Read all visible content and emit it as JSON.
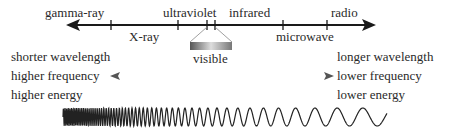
{
  "spectrum": {
    "top_labels": [
      "gamma-ray",
      "ultraviolet",
      "infrared",
      "radio"
    ],
    "bottom_labels": [
      "X-ray",
      "microwave"
    ],
    "visible_label": "visible"
  },
  "left_properties": [
    "shorter wavelength",
    "higher frequency",
    "higher energy"
  ],
  "right_properties": [
    "longer wavelength",
    "lower frequency",
    "lower energy"
  ],
  "colors": {
    "axis": "#1a1a1a",
    "text": "#2a2a2a",
    "arrow_gray": "#666666"
  }
}
